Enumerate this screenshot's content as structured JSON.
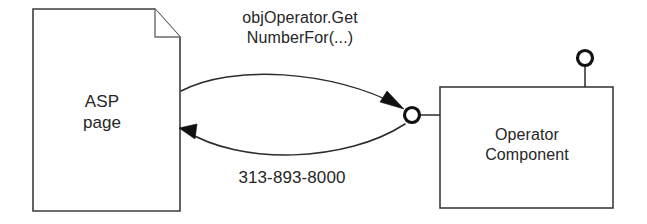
{
  "diagram": {
    "type": "uml-component-interaction",
    "background_color": "#ffffff",
    "stroke_color": "#2b2b2b",
    "text_color": "#262626",
    "nodes": {
      "asp_page": {
        "shape": "document-with-folded-corner",
        "label": "ASP\npage",
        "line1": "ASP",
        "line2": "page"
      },
      "operator_component": {
        "shape": "rectangle",
        "label": "Operator\nComponent",
        "line1": "Operator",
        "line2": "Component"
      }
    },
    "interfaces": {
      "provided_interface_left": {
        "shape": "lollipop-circle"
      },
      "provided_interface_top": {
        "shape": "lollipop-circle"
      }
    },
    "messages": {
      "call": {
        "line1": "objOperator.Get",
        "line2": "NumberFor(...)",
        "full": "objOperator.GetNumberFor(...)",
        "direction": "asp-page-to-operator-component"
      },
      "return": {
        "line1": "313-893-8000",
        "full": "313-893-8000",
        "direction": "operator-component-to-asp-page"
      }
    }
  }
}
